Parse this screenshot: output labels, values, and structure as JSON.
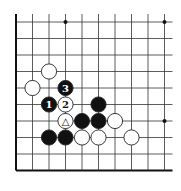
{
  "board": {
    "cols": 10,
    "rows": 10,
    "origin_x": 16,
    "origin_y": 22,
    "spacing": 16.5,
    "open_top": true,
    "open_right": true,
    "line_color": "#333333",
    "edge_color": "#111111"
  },
  "star_points": [
    {
      "col": 3,
      "row": 0
    },
    {
      "col": 9,
      "row": 0
    },
    {
      "col": 9,
      "row": 6
    }
  ],
  "stones": [
    {
      "color": "white",
      "col": 2,
      "row": 3,
      "label": ""
    },
    {
      "color": "white",
      "col": 1,
      "row": 4,
      "label": ""
    },
    {
      "color": "black",
      "col": 3,
      "row": 4,
      "label": "3"
    },
    {
      "color": "black",
      "col": 2,
      "row": 5,
      "label": "1"
    },
    {
      "color": "white",
      "col": 3,
      "row": 5,
      "label": "2"
    },
    {
      "color": "black",
      "col": 5,
      "row": 5,
      "label": ""
    },
    {
      "color": "white",
      "col": 3,
      "row": 6,
      "label": "△"
    },
    {
      "color": "black",
      "col": 4,
      "row": 6,
      "label": ""
    },
    {
      "color": "black",
      "col": 5,
      "row": 6,
      "label": ""
    },
    {
      "color": "white",
      "col": 6,
      "row": 6,
      "label": ""
    },
    {
      "color": "black",
      "col": 2,
      "row": 7,
      "label": ""
    },
    {
      "color": "black",
      "col": 3,
      "row": 7,
      "label": ""
    },
    {
      "color": "white",
      "col": 4,
      "row": 7,
      "label": ""
    },
    {
      "color": "white",
      "col": 5,
      "row": 7,
      "label": ""
    },
    {
      "color": "white",
      "col": 7,
      "row": 7,
      "label": ""
    }
  ]
}
